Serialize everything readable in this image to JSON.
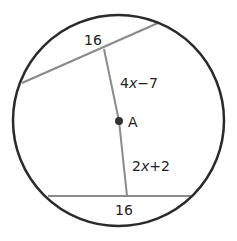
{
  "diagram": {
    "type": "circle-chords",
    "circle": {
      "cx": 118.5,
      "cy": 120.5,
      "r": 105.5,
      "stroke": "#2a2a2a"
    },
    "center_point": {
      "label": "A",
      "x": 119,
      "y": 121
    },
    "chords": [
      {
        "name": "top-chord",
        "x1": 22,
        "y1": 83,
        "x2": 158,
        "y2": 23,
        "length_label": "16"
      },
      {
        "name": "bottom-chord",
        "x1": 48,
        "y1": 196,
        "x2": 191,
        "y2": 196,
        "length_label": "16"
      }
    ],
    "segments": [
      {
        "name": "upper-distance",
        "x1": 104,
        "y1": 49,
        "x2": 119,
        "y2": 121,
        "label": "4x−7"
      },
      {
        "name": "lower-distance",
        "x1": 119,
        "y1": 121,
        "x2": 127,
        "y2": 196,
        "label": "2x+2"
      }
    ],
    "line_color": "#8a8a8a"
  },
  "labels": {
    "top_chord": "16",
    "bottom_chord": "16",
    "upper_segment_coef": "4",
    "upper_segment_var": "x",
    "upper_segment_rest": "−7",
    "lower_segment_coef": "2",
    "lower_segment_var": "x",
    "lower_segment_rest": "+2",
    "center": "A"
  }
}
